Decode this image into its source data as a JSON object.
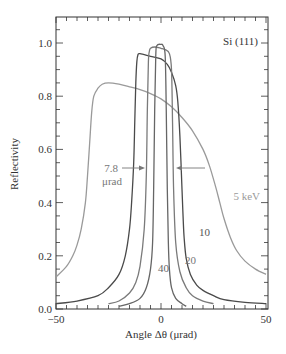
{
  "chart_data": {
    "type": "line",
    "title": "",
    "annotation_title": "Si (111)",
    "xlabel": "Angle Δθ (μrad)",
    "ylabel": "Reflectivity",
    "xlim": [
      -50,
      50
    ],
    "ylim": [
      0.0,
      1.05
    ],
    "x_ticks": [
      -50,
      0,
      50
    ],
    "x_tick_labels": [
      "−50",
      "0",
      "50"
    ],
    "x_minor_step": 5,
    "y_ticks": [
      0.0,
      0.2,
      0.4,
      0.6,
      0.8,
      1.0
    ],
    "y_tick_labels": [
      "0.0",
      "0.2",
      "0.4",
      "0.6",
      "0.8",
      "1.0"
    ],
    "y_minor_step": 0.05,
    "grid": false,
    "legend": "none (inline labels)",
    "series": [
      {
        "name": "5 keV",
        "label": "5 keV",
        "color": "#9a9a9a",
        "x": [
          -50,
          -45,
          -42,
          -40,
          -38,
          -36,
          -35,
          -34,
          -33,
          -32,
          -30,
          -28,
          -25,
          -20,
          -15,
          -10,
          -5,
          0,
          5,
          10,
          15,
          20,
          23,
          26,
          28,
          30,
          33,
          36,
          40,
          45,
          50
        ],
        "y": [
          0.12,
          0.16,
          0.2,
          0.24,
          0.3,
          0.4,
          0.5,
          0.62,
          0.74,
          0.8,
          0.83,
          0.845,
          0.85,
          0.845,
          0.835,
          0.825,
          0.81,
          0.79,
          0.76,
          0.72,
          0.67,
          0.6,
          0.54,
          0.46,
          0.4,
          0.34,
          0.27,
          0.22,
          0.18,
          0.15,
          0.13
        ]
      },
      {
        "name": "10 keV",
        "label": "10",
        "color": "#4a4a4a",
        "x": [
          -50,
          -40,
          -30,
          -25,
          -20,
          -17,
          -15,
          -14,
          -13,
          -12.5,
          -12,
          -11.5,
          -11,
          -10,
          -5,
          0,
          3,
          5,
          7,
          8,
          9,
          10,
          10.5,
          11,
          12,
          14,
          17,
          20,
          25,
          30,
          40,
          50
        ],
        "y": [
          0.02,
          0.03,
          0.05,
          0.08,
          0.13,
          0.2,
          0.3,
          0.4,
          0.55,
          0.7,
          0.85,
          0.93,
          0.955,
          0.96,
          0.95,
          0.94,
          0.92,
          0.89,
          0.84,
          0.78,
          0.65,
          0.45,
          0.35,
          0.27,
          0.19,
          0.13,
          0.09,
          0.07,
          0.05,
          0.035,
          0.025,
          0.02
        ]
      },
      {
        "name": "20 keV",
        "label": "20",
        "color": "#7a7a7a",
        "x": [
          -25,
          -20,
          -15,
          -12,
          -10,
          -8,
          -7,
          -6.5,
          -6,
          -5.5,
          -5,
          -3,
          0,
          2,
          4,
          5,
          5.5,
          6,
          7,
          9,
          12,
          15,
          20,
          25
        ],
        "y": [
          0.02,
          0.03,
          0.06,
          0.1,
          0.16,
          0.3,
          0.5,
          0.75,
          0.93,
          0.97,
          0.98,
          0.985,
          0.98,
          0.975,
          0.96,
          0.9,
          0.7,
          0.45,
          0.25,
          0.14,
          0.08,
          0.05,
          0.03,
          0.02
        ]
      },
      {
        "name": "40 keV",
        "label": "40",
        "color": "#666666",
        "x": [
          -20,
          -15,
          -10,
          -7,
          -5,
          -4,
          -3.5,
          -3,
          -2.5,
          -2,
          0,
          1,
          2,
          2.5,
          3,
          3.5,
          4,
          5,
          7,
          10,
          12
        ],
        "y": [
          0.01,
          0.02,
          0.04,
          0.08,
          0.15,
          0.25,
          0.45,
          0.75,
          0.95,
          0.99,
          0.995,
          0.99,
          0.95,
          0.75,
          0.45,
          0.25,
          0.15,
          0.08,
          0.04,
          0.02,
          0.01
        ]
      }
    ],
    "annotations": [
      {
        "text_line1": "7.8",
        "text_line2": "μrad",
        "meaning": "width arrows pointing inward at 40 keV curve"
      }
    ]
  }
}
